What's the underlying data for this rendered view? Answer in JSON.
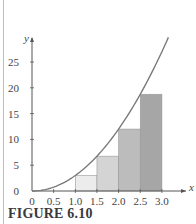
{
  "caption": "FIGURE 6.10",
  "chart_data": {
    "type": "bar",
    "title": "",
    "xlabel": "x",
    "ylabel": "y",
    "xlim": [
      0,
      3.0
    ],
    "ylim": [
      0,
      27
    ],
    "grid": false,
    "x_ticks": [
      "0",
      "0.5",
      "1.0",
      "1.5",
      "2.0",
      "2.5",
      "3.0"
    ],
    "y_ticks": [
      "0",
      "5",
      "10",
      "15",
      "20",
      "25"
    ],
    "curve": {
      "label": "y = 3x^2",
      "x_range": [
        0,
        3
      ],
      "color": "#7a7a7a"
    },
    "bars": [
      {
        "x0": 1.0,
        "x1": 1.5,
        "height": 3.0,
        "color": "#ececec"
      },
      {
        "x0": 1.5,
        "x1": 2.0,
        "height": 6.75,
        "color": "#d4d4d4"
      },
      {
        "x0": 2.0,
        "x1": 2.5,
        "height": 12.0,
        "color": "#bcbcbc"
      },
      {
        "x0": 2.5,
        "x1": 3.0,
        "height": 18.75,
        "color": "#a6a6a6"
      }
    ]
  }
}
